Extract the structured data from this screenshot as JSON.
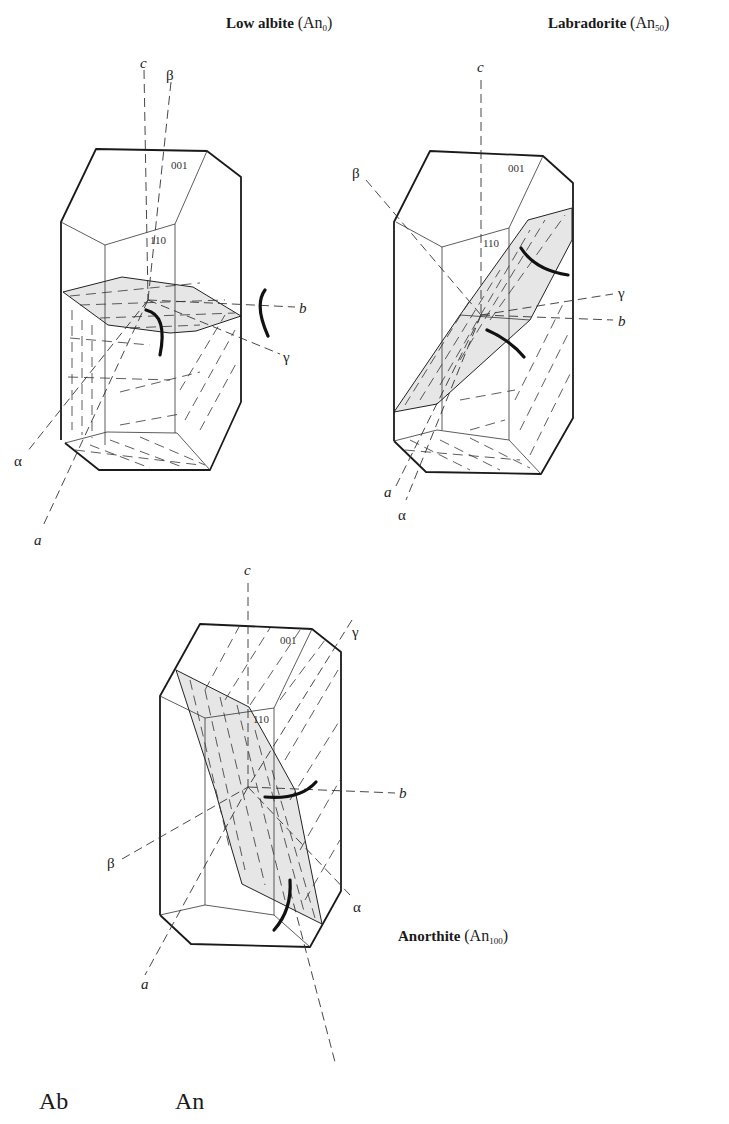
{
  "crystals": [
    {
      "name": "Low albite",
      "composition_prefix": "An",
      "composition_subscript": "0",
      "faces": [
        "001",
        "110"
      ],
      "axes": {
        "c": "c",
        "a": "a",
        "b": "b",
        "alpha": "α",
        "beta": "β",
        "gamma": "γ"
      }
    },
    {
      "name": "Labradorite",
      "composition_prefix": "An",
      "composition_subscript": "50",
      "faces": [
        "001",
        "110"
      ],
      "axes": {
        "c": "c",
        "a": "a",
        "b": "b",
        "alpha": "α",
        "beta": "β",
        "gamma": "γ"
      }
    },
    {
      "name": "Anorthite",
      "composition_prefix": "An",
      "composition_subscript": "100",
      "faces": [
        "001",
        "110"
      ],
      "axes": {
        "c": "c",
        "a": "a",
        "b": "b",
        "alpha": "α",
        "beta": "β",
        "gamma": "γ"
      }
    }
  ],
  "bottom_labels": {
    "left": "Ab",
    "right": "An"
  },
  "colors": {
    "line": "#1a1a1a",
    "plane_fill": "#e6e6e6",
    "background": "#ffffff"
  }
}
